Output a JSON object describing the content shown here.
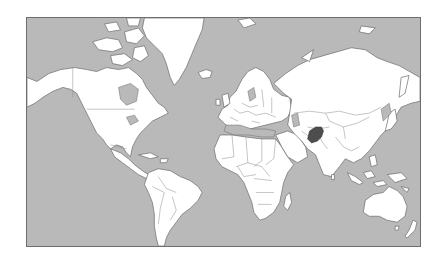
{
  "map": {
    "type": "world-political-outline",
    "projection": "Mercator",
    "colors": {
      "ocean": "#b9b9b9",
      "land": "#ffffff",
      "coastline": "#6a6a6a",
      "border": "#8a8a8a",
      "highlight": "#4d4d4d",
      "frame": "#6e6e6e",
      "page_background": "#ffffff"
    },
    "highlighted_country": {
      "name": "Afghanistan",
      "color": "#4d4d4d"
    },
    "continents": [
      "North America",
      "Greenland",
      "South America",
      "Europe",
      "Africa",
      "Asia",
      "Australia",
      "New Zealand"
    ]
  }
}
